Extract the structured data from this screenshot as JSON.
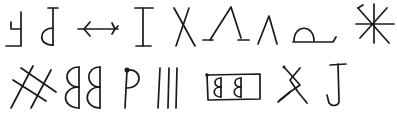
{
  "title": "Handwritten symbol sheet",
  "stroke_color": "#1a1a1a",
  "background_color": "#ffffff",
  "rows": [
    {
      "row": 1,
      "symbols": [
        {
          "id": "r1-s1",
          "description": "mirrored F / reversed E-like hook"
        },
        {
          "id": "r1-s2",
          "description": "mirrored b with top bar"
        },
        {
          "id": "r1-s3",
          "description": "arrow pointing left with fletched tail"
        },
        {
          "id": "r1-s4",
          "description": "capital I with serifs"
        },
        {
          "id": "r1-s5",
          "description": "X cross"
        },
        {
          "id": "r1-s6",
          "description": "large inverted V with feet"
        },
        {
          "id": "r1-s7",
          "description": "small inverted V"
        },
        {
          "id": "r1-s8",
          "description": "semicircle dome on baseline"
        },
        {
          "id": "r1-s9",
          "description": "eight-spoked star / asterisk"
        }
      ]
    },
    {
      "row": 2,
      "symbols": [
        {
          "id": "r2-s1",
          "description": "hash / double cross-hatch"
        },
        {
          "id": "r2-s2",
          "description": "mirrored double B"
        },
        {
          "id": "r2-s3",
          "description": "P with dot"
        },
        {
          "id": "r2-s4",
          "description": "three vertical lines"
        },
        {
          "id": "r2-s5",
          "description": "boxed mirrored B B"
        },
        {
          "id": "r2-s6",
          "description": "crossed X with loop"
        },
        {
          "id": "r2-s7",
          "description": "capital J"
        }
      ]
    }
  ]
}
